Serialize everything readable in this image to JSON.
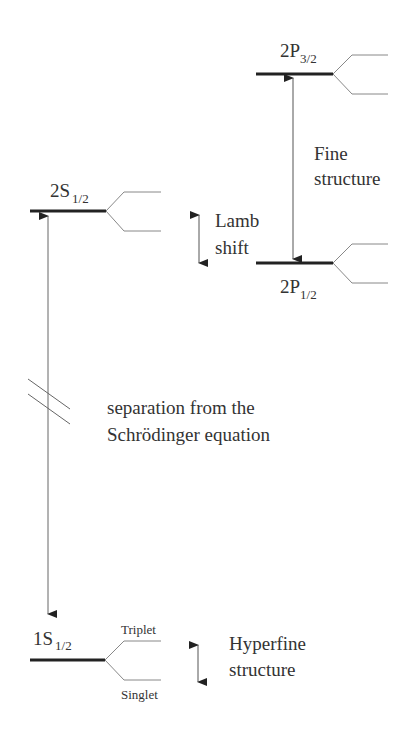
{
  "diagram": {
    "type": "energy-level-diagram",
    "levels": [
      {
        "id": "2P32",
        "base": "2P",
        "sub": "3/2"
      },
      {
        "id": "2S12",
        "base": "2S",
        "sub": "1/2"
      },
      {
        "id": "2P12",
        "base": "2P",
        "sub": "1/2"
      },
      {
        "id": "1S12",
        "base": "1S",
        "sub": "1/2"
      }
    ],
    "annotations": {
      "fine_line1": "Fine",
      "fine_line2": "structure",
      "lamb_line1": "Lamb",
      "lamb_line2": "shift",
      "sep_line1": "separation from  the",
      "sep_line2": "Schrödinger equation",
      "hyper_line1": "Hyperfine",
      "hyper_line2": "structure",
      "triplet": "Triplet",
      "singlet": "Singlet"
    },
    "colors": {
      "level_line": "#222222",
      "split_line": "#888888",
      "arrow": "#555555",
      "text": "#333333"
    }
  }
}
